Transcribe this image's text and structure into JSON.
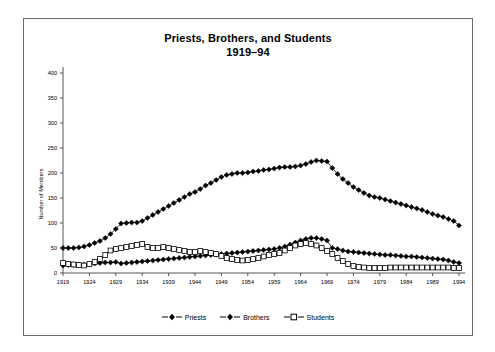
{
  "chart": {
    "title_line1": "Priests, Brothers, and Students",
    "title_line2": "1919–94",
    "ylabel": "Number of Members"
  },
  "legend": {
    "position": "bottom-center",
    "entries": [
      {
        "label": "Priests",
        "marker": "filled-diamond-icon",
        "color": "#000000"
      },
      {
        "label": "Brothers",
        "marker": "filled-diamond-icon",
        "color": "#000000"
      },
      {
        "label": "Students",
        "marker": "open-square-icon",
        "color": "#000000"
      }
    ]
  },
  "axes": {
    "y_ticks": [
      "0",
      "50",
      "100",
      "150",
      "200",
      "250",
      "300",
      "350",
      "400"
    ],
    "x_ticks": [
      "1919",
      "1924",
      "1929",
      "1934",
      "1939",
      "1944",
      "1949",
      "1954",
      "1959",
      "1964",
      "1969",
      "1974",
      "1979",
      "1984",
      "1989",
      "1994"
    ]
  },
  "chart_data": {
    "type": "line",
    "title": "Priests, Brothers, and Students 1919–94",
    "xlabel": "",
    "ylabel": "Number of Members",
    "xlim": [
      1919,
      1994
    ],
    "ylim": [
      0,
      400
    ],
    "ytick_step": 50,
    "xtick_step": 5,
    "grid": false,
    "legend_position": "bottom-center",
    "x": [
      1919,
      1920,
      1921,
      1922,
      1923,
      1924,
      1925,
      1926,
      1927,
      1928,
      1929,
      1930,
      1931,
      1932,
      1933,
      1934,
      1935,
      1936,
      1937,
      1938,
      1939,
      1940,
      1941,
      1942,
      1943,
      1944,
      1945,
      1946,
      1947,
      1948,
      1949,
      1950,
      1951,
      1952,
      1953,
      1954,
      1955,
      1956,
      1957,
      1958,
      1959,
      1960,
      1961,
      1962,
      1963,
      1964,
      1965,
      1966,
      1967,
      1968,
      1969,
      1970,
      1971,
      1972,
      1973,
      1974,
      1975,
      1976,
      1977,
      1978,
      1979,
      1980,
      1981,
      1982,
      1983,
      1984,
      1985,
      1986,
      1987,
      1988,
      1989,
      1990,
      1991,
      1992,
      1993,
      1994
    ],
    "series": [
      {
        "name": "Priests",
        "marker": "filled-diamond",
        "color": "#000000",
        "values": [
          50,
          50,
          50,
          51,
          53,
          56,
          60,
          64,
          70,
          78,
          88,
          99,
          100,
          101,
          101,
          104,
          110,
          116,
          122,
          128,
          134,
          140,
          146,
          152,
          158,
          162,
          168,
          175,
          180,
          186,
          192,
          196,
          198,
          200,
          200,
          201,
          203,
          204,
          206,
          207,
          209,
          211,
          212,
          212,
          213,
          215,
          218,
          222,
          225,
          224,
          223,
          210,
          198,
          188,
          180,
          172,
          166,
          160,
          155,
          152,
          150,
          147,
          144,
          141,
          138,
          135,
          132,
          129,
          126,
          122,
          118,
          115,
          112,
          108,
          104,
          95
        ]
      },
      {
        "name": "Brothers",
        "marker": "filled-diamond",
        "color": "#000000",
        "values": [
          15,
          16,
          16,
          17,
          17,
          18,
          19,
          20,
          21,
          21,
          22,
          19,
          20,
          21,
          22,
          23,
          24,
          25,
          26,
          27,
          28,
          29,
          30,
          31,
          32,
          33,
          34,
          35,
          36,
          37,
          38,
          39,
          40,
          41,
          42,
          43,
          44,
          45,
          46,
          47,
          48,
          50,
          53,
          57,
          61,
          65,
          68,
          70,
          70,
          68,
          65,
          50,
          48,
          45,
          43,
          42,
          41,
          40,
          39,
          38,
          37,
          36,
          36,
          35,
          34,
          33,
          33,
          32,
          31,
          30,
          29,
          28,
          27,
          25,
          22,
          20
        ]
      },
      {
        "name": "Students",
        "marker": "open-square",
        "color": "#000000",
        "values": [
          20,
          18,
          17,
          16,
          15,
          18,
          22,
          28,
          36,
          45,
          48,
          50,
          52,
          54,
          56,
          58,
          52,
          50,
          50,
          52,
          50,
          48,
          46,
          44,
          42,
          42,
          44,
          42,
          40,
          38,
          34,
          30,
          28,
          26,
          25,
          26,
          28,
          30,
          33,
          36,
          38,
          40,
          45,
          50,
          55,
          58,
          60,
          58,
          55,
          50,
          44,
          38,
          30,
          24,
          18,
          14,
          12,
          11,
          10,
          10,
          10,
          10,
          11,
          11,
          11,
          11,
          11,
          11,
          11,
          11,
          11,
          11,
          11,
          11,
          10,
          10
        ]
      }
    ]
  }
}
